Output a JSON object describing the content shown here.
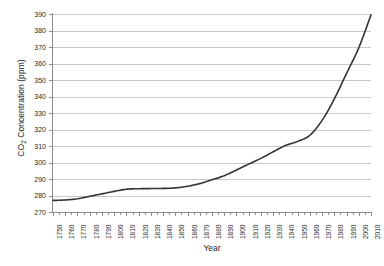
{
  "chart_data": {
    "type": "line",
    "title": "",
    "xlabel": "Year",
    "ylabel": "CO2 Concentration (ppm)",
    "ylabel_prefix": "CO",
    "ylabel_sub": "2",
    "ylabel_suffix": " Concentration (ppm)",
    "xlim": [
      1750,
      2010
    ],
    "ylim": [
      270,
      390
    ],
    "yticks": [
      270,
      280,
      290,
      300,
      310,
      320,
      330,
      340,
      350,
      360,
      370,
      380,
      390
    ],
    "ytick_labels": [
      "270",
      "280",
      "290",
      "300",
      "310",
      "320",
      "330",
      "340",
      "350",
      "360",
      "370",
      "380",
      "390"
    ],
    "xticks": [
      1750,
      1760,
      1770,
      1780,
      1790,
      1800,
      1810,
      1820,
      1830,
      1840,
      1850,
      1860,
      1870,
      1880,
      1890,
      1900,
      1910,
      1920,
      1930,
      1940,
      1950,
      1960,
      1970,
      1980,
      1990,
      2000,
      2010
    ],
    "xtick_labels": [
      "1750",
      "1760",
      "1770",
      "1780",
      "1790",
      "1800",
      "1810",
      "1820",
      "1830",
      "1840",
      "1850",
      "1860",
      "1870",
      "1880",
      "1890",
      "1900",
      "1910",
      "1920",
      "1930",
      "1940",
      "1950",
      "1960",
      "1970",
      "1980",
      "1990",
      "2000",
      "2010"
    ],
    "grid": true,
    "grid_axis": "y",
    "legend": "none",
    "series": [
      {
        "name": "CO2 concentration",
        "color": "#333333",
        "x": [
          1750,
          1760,
          1770,
          1780,
          1790,
          1800,
          1810,
          1820,
          1830,
          1840,
          1850,
          1860,
          1870,
          1880,
          1890,
          1900,
          1910,
          1920,
          1930,
          1940,
          1950,
          1960,
          1970,
          1980,
          1990,
          2000,
          2010
        ],
        "values": [
          277,
          277.3,
          278,
          279.5,
          281,
          282.5,
          283.8,
          284.1,
          284.2,
          284.3,
          284.6,
          285.6,
          287.2,
          289.5,
          292,
          295.5,
          299,
          302.5,
          306.5,
          310.3,
          312.8,
          316.5,
          325.5,
          338.5,
          354,
          369.5,
          389.5
        ]
      }
    ]
  }
}
